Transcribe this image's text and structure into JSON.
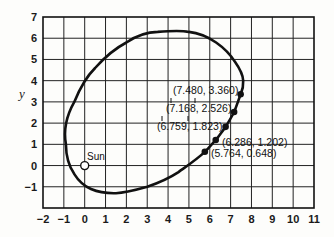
{
  "chart_data": {
    "type": "scatter",
    "title": "",
    "xlabel": "",
    "ylabel": "y",
    "xlim": [
      -2,
      11
    ],
    "ylim": [
      -2,
      7
    ],
    "grid": true,
    "x_ticks": [
      "-2",
      "-1",
      "0",
      "1",
      "2",
      "3",
      "4",
      "5",
      "6",
      "7",
      "8",
      "9",
      "10",
      "11"
    ],
    "y_ticks": [
      "-1",
      "0",
      "1",
      "2",
      "3",
      "4",
      "5",
      "6",
      "7"
    ],
    "series": [
      {
        "name": "orbit",
        "kind": "ellipse",
        "approx_extents": {
          "x_min": -0.9,
          "x_max": 7.6,
          "y_min": -1.3,
          "y_max": 6.3
        }
      },
      {
        "name": "computed points",
        "kind": "scatter",
        "points": [
          {
            "x": 7.48,
            "y": 3.36,
            "label": "(7.480, 3.360)"
          },
          {
            "x": 7.168,
            "y": 2.526,
            "label": "(7.168, 2.526)"
          },
          {
            "x": 6.759,
            "y": 1.823,
            "label": "(6.759, 1.823)"
          },
          {
            "x": 6.286,
            "y": 1.202,
            "label": "(6.286, 1.202)"
          },
          {
            "x": 5.764,
            "y": 0.648,
            "label": "(5.764, 0.648)"
          }
        ]
      }
    ],
    "annotations": [
      {
        "text": "Sun",
        "x": 0,
        "y": 0,
        "marker": "open-circle"
      }
    ]
  }
}
